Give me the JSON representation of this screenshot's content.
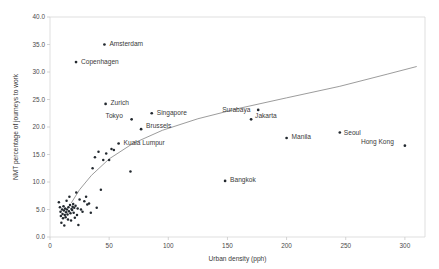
{
  "chart_data": {
    "type": "scatter",
    "title": "",
    "xlabel": "Urban density (pph)",
    "ylabel": "NMT percentage of journeys to work",
    "xlim": [
      0,
      317
    ],
    "ylim": [
      0,
      40
    ],
    "xticks": [
      0,
      50,
      100,
      150,
      200,
      250,
      300
    ],
    "xtick_labels": [
      "0",
      "50",
      "100",
      "150",
      "200",
      "250",
      "300"
    ],
    "yticks": [
      0.0,
      5.0,
      10.0,
      15.0,
      20.0,
      25.0,
      30.0,
      35.0,
      40.0
    ],
    "ytick_labels": [
      "0.0",
      "5.0",
      "10.0",
      "15.0",
      "20.0",
      "25.0",
      "30.0",
      "35.0",
      "40.0"
    ],
    "grid": false,
    "legend": "none",
    "marker_color": "#23292f",
    "trend_color": "#8a8a8a",
    "labeled_points": [
      {
        "name": "Amsterdam",
        "x": 46,
        "y": 35.0,
        "label_dx": 5,
        "label_dy": 1.5
      },
      {
        "name": "Copenhagen",
        "x": 22,
        "y": 31.8,
        "label_dx": 5,
        "label_dy": 1.5
      },
      {
        "name": "Zurich",
        "x": 47,
        "y": 24.2,
        "label_dx": 5,
        "label_dy": 1.5
      },
      {
        "name": "Singapore",
        "x": 86,
        "y": 22.5,
        "label_dx": 5,
        "label_dy": 1.5
      },
      {
        "name": "Tokyo",
        "x": 69,
        "y": 21.4,
        "label_dx": -26,
        "label_dy": -1.2
      },
      {
        "name": "Brussels",
        "x": 77,
        "y": 19.6,
        "label_dx": 5,
        "label_dy": -1.2
      },
      {
        "name": "Kuala Lumpur",
        "x": 58,
        "y": 17.0,
        "label_dx": 5,
        "label_dy": 1.5
      },
      {
        "name": "Surabaya",
        "x": 176,
        "y": 23.1,
        "label_dx": -36,
        "label_dy": 1.8
      },
      {
        "name": "Jakarta",
        "x": 170,
        "y": 21.4,
        "label_dx": 4,
        "label_dy": -1.8
      },
      {
        "name": "Manila",
        "x": 200,
        "y": 18.0,
        "label_dx": 5,
        "label_dy": 1.4
      },
      {
        "name": "Seoul",
        "x": 245,
        "y": 19.0,
        "label_dx": 4,
        "label_dy": 2.0
      },
      {
        "name": "Hong Kong",
        "x": 300,
        "y": 16.6,
        "label_dx": -44,
        "label_dy": -1.6
      },
      {
        "name": "Bangkok",
        "x": 148,
        "y": 10.2,
        "label_dx": 5,
        "label_dy": 1.5
      }
    ],
    "unlabeled_points": [
      {
        "x": 7.5,
        "y": 6.3
      },
      {
        "x": 8.4,
        "y": 5.4
      },
      {
        "x": 8.9,
        "y": 4.6
      },
      {
        "x": 9.2,
        "y": 3.8
      },
      {
        "x": 9.6,
        "y": 2.6
      },
      {
        "x": 10.2,
        "y": 5.0
      },
      {
        "x": 10.6,
        "y": 4.2
      },
      {
        "x": 11.0,
        "y": 3.4
      },
      {
        "x": 11.4,
        "y": 5.6
      },
      {
        "x": 11.8,
        "y": 4.8
      },
      {
        "x": 12.1,
        "y": 2.1
      },
      {
        "x": 12.5,
        "y": 4.0
      },
      {
        "x": 12.8,
        "y": 5.2
      },
      {
        "x": 13.2,
        "y": 3.6
      },
      {
        "x": 13.6,
        "y": 4.5
      },
      {
        "x": 14.0,
        "y": 6.6
      },
      {
        "x": 14.3,
        "y": 5.0
      },
      {
        "x": 14.8,
        "y": 4.1
      },
      {
        "x": 15.2,
        "y": 3.2
      },
      {
        "x": 15.6,
        "y": 5.4
      },
      {
        "x": 16.0,
        "y": 4.7
      },
      {
        "x": 16.4,
        "y": 7.3
      },
      {
        "x": 16.9,
        "y": 5.8
      },
      {
        "x": 17.3,
        "y": 4.3
      },
      {
        "x": 17.8,
        "y": 3.0
      },
      {
        "x": 18.2,
        "y": 5.1
      },
      {
        "x": 18.7,
        "y": 4.9
      },
      {
        "x": 19.1,
        "y": 5.5
      },
      {
        "x": 19.6,
        "y": 6.0
      },
      {
        "x": 20.0,
        "y": 4.4
      },
      {
        "x": 20.5,
        "y": 5.3
      },
      {
        "x": 21.0,
        "y": 3.5
      },
      {
        "x": 21.6,
        "y": 5.7
      },
      {
        "x": 22.2,
        "y": 8.1
      },
      {
        "x": 22.8,
        "y": 4.0
      },
      {
        "x": 23.4,
        "y": 5.2
      },
      {
        "x": 24.0,
        "y": 2.2
      },
      {
        "x": 25.0,
        "y": 6.8
      },
      {
        "x": 26.2,
        "y": 5.0
      },
      {
        "x": 27.5,
        "y": 4.6
      },
      {
        "x": 29.0,
        "y": 6.5
      },
      {
        "x": 30.5,
        "y": 7.3
      },
      {
        "x": 31.5,
        "y": 5.9
      },
      {
        "x": 33.0,
        "y": 6.1
      },
      {
        "x": 34.5,
        "y": 4.4
      },
      {
        "x": 36.0,
        "y": 12.5
      },
      {
        "x": 38.0,
        "y": 14.5
      },
      {
        "x": 39.5,
        "y": 5.3
      },
      {
        "x": 41.0,
        "y": 15.5
      },
      {
        "x": 43.0,
        "y": 8.6
      },
      {
        "x": 45.0,
        "y": 14.0
      },
      {
        "x": 47.5,
        "y": 15.2
      },
      {
        "x": 50.0,
        "y": 14.0
      },
      {
        "x": 52.0,
        "y": 16.0
      },
      {
        "x": 54.0,
        "y": 15.8
      },
      {
        "x": 68.0,
        "y": 11.9
      }
    ],
    "trend_line": {
      "description": "logarithmic best-fit curve",
      "points": [
        {
          "x": 18,
          "y": 6.2
        },
        {
          "x": 25,
          "y": 8.6
        },
        {
          "x": 35,
          "y": 11.2
        },
        {
          "x": 50,
          "y": 14.2
        },
        {
          "x": 70,
          "y": 17.0
        },
        {
          "x": 95,
          "y": 19.4
        },
        {
          "x": 125,
          "y": 21.5
        },
        {
          "x": 160,
          "y": 23.4
        },
        {
          "x": 200,
          "y": 25.3
        },
        {
          "x": 245,
          "y": 27.4
        },
        {
          "x": 285,
          "y": 29.6
        },
        {
          "x": 310,
          "y": 31.0
        }
      ]
    }
  },
  "axes": {
    "x_title": "Urban density (pph)",
    "y_title": "NMT percentage of journeys to work"
  }
}
